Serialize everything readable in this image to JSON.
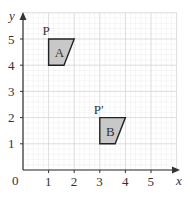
{
  "diagram": {
    "type": "coordinate-grid-translation",
    "axes": {
      "x_label": "x",
      "y_label": "y",
      "origin_label": "0",
      "x_ticks": [
        "1",
        "2",
        "3",
        "4",
        "5"
      ],
      "y_ticks": [
        "1",
        "2",
        "3",
        "4",
        "5"
      ],
      "x_range": [
        0,
        6
      ],
      "y_range": [
        0,
        6
      ],
      "grid": true,
      "minor_subdivisions": 5
    },
    "shapes": [
      {
        "label": "A",
        "vertices": [
          [
            1,
            5
          ],
          [
            2,
            5
          ],
          [
            1.6,
            4
          ],
          [
            1,
            4
          ]
        ],
        "point_label": "P",
        "point": [
          1,
          5
        ],
        "fill": "#c8c8c8"
      },
      {
        "label": "B",
        "vertices": [
          [
            3,
            2
          ],
          [
            4,
            2
          ],
          [
            3.6,
            1
          ],
          [
            3,
            1
          ]
        ],
        "point_label": "P′",
        "point": [
          3,
          2
        ],
        "fill": "#c8c8c8"
      }
    ],
    "colors": {
      "axis": "#333333",
      "grid_major": "#d4d4d4",
      "grid_minor": "#ececec",
      "shape_stroke": "#222222"
    }
  }
}
